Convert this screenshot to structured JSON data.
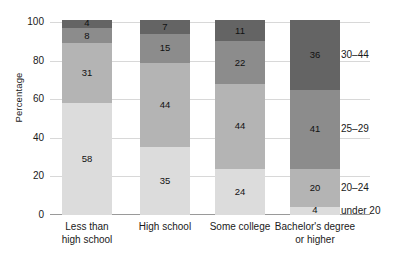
{
  "chart_data": {
    "type": "bar",
    "subtype": "stacked-bar",
    "title": "",
    "xlabel": "",
    "ylabel": "Percentage",
    "ylim": [
      0,
      100
    ],
    "yticks": [
      0,
      20,
      40,
      60,
      80,
      100
    ],
    "grid": true,
    "legend_position": "right-inline",
    "categories": [
      "Less than high school",
      "High school",
      "Some college",
      "Bachelor's degree or higher"
    ],
    "category_lines": [
      [
        "Less than",
        "high school"
      ],
      [
        "High school"
      ],
      [
        "Some college"
      ],
      [
        "Bachelor's degree",
        "or higher"
      ]
    ],
    "series": [
      {
        "name": "under 20",
        "color": "#dcdcdc",
        "values": [
          58,
          35,
          24,
          4
        ]
      },
      {
        "name": "20–24",
        "color": "#b4b4b4",
        "values": [
          31,
          44,
          44,
          20
        ]
      },
      {
        "name": "25–29",
        "color": "#8c8c8c",
        "values": [
          8,
          15,
          22,
          41
        ]
      },
      {
        "name": "30–44",
        "color": "#646464",
        "values": [
          4,
          7,
          11,
          36
        ]
      }
    ],
    "stack_order": "bottom-to-top",
    "value_labels": {
      "less_than_high_school": [
        "58",
        "31",
        "8",
        "4"
      ],
      "high_school": [
        "35",
        "44",
        "15",
        "7"
      ],
      "some_college": [
        "24",
        "44",
        "22",
        "11"
      ],
      "bachelors_or_higher": [
        "4",
        "20",
        "41",
        "36"
      ]
    }
  },
  "axis": {
    "y_title": "Percentage",
    "y_tick_labels": [
      "100",
      "80",
      "60",
      "40",
      "20",
      "0"
    ]
  },
  "legend_labels": [
    "30–44",
    "25–29",
    "20–24",
    "under 20"
  ]
}
